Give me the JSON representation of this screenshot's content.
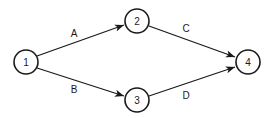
{
  "diagram": {
    "type": "activity-on-arrow network",
    "nodes": [
      {
        "id": "1",
        "label": "1",
        "x": 26,
        "y": 62
      },
      {
        "id": "2",
        "label": "2",
        "x": 137,
        "y": 21
      },
      {
        "id": "3",
        "label": "3",
        "x": 137,
        "y": 100
      },
      {
        "id": "4",
        "label": "4",
        "x": 248,
        "y": 62
      }
    ],
    "edges": [
      {
        "from": "1",
        "to": "2",
        "label": "A",
        "label_x": 74,
        "label_y": 33
      },
      {
        "from": "1",
        "to": "3",
        "label": "B",
        "label_x": 74,
        "label_y": 89
      },
      {
        "from": "2",
        "to": "4",
        "label": "C",
        "label_x": 186,
        "label_y": 28
      },
      {
        "from": "3",
        "to": "4",
        "label": "D",
        "label_x": 186,
        "label_y": 95
      }
    ],
    "colors": {
      "stroke": "#1a1a1a",
      "background": "#ffffff"
    }
  }
}
